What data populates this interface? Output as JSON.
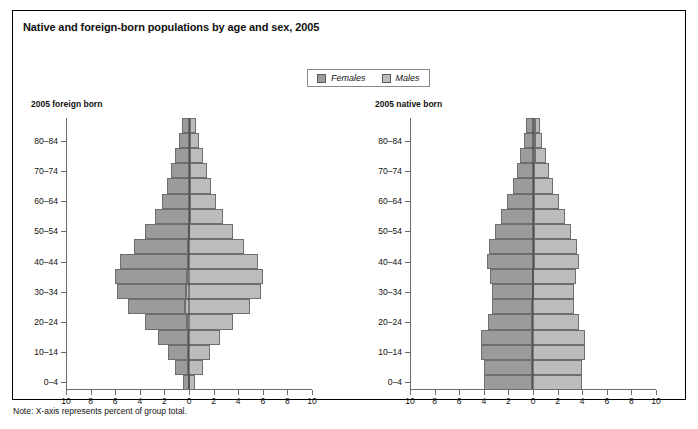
{
  "figure": {
    "title": "Native and foreign-born populations by age and sex, 2005",
    "note": "Note:  X-axis represents percent of group total."
  },
  "legend": {
    "entries": [
      {
        "label": "Females",
        "color": "#9b9b9b",
        "key": "females"
      },
      {
        "label": "Males",
        "color": "#bcbcbc",
        "key": "males"
      }
    ]
  },
  "panels": [
    {
      "id": "foreign",
      "title": "2005 foreign born"
    },
    {
      "id": "native",
      "title": "2005 native born"
    }
  ],
  "axis": {
    "x_tick_labels": [
      "10",
      "8",
      "6",
      "4",
      "2",
      "0",
      "2",
      "4",
      "6",
      "8",
      "10"
    ],
    "x_min": -10,
    "x_max": 10,
    "y_tick_labels": [
      "0–4",
      "10–14",
      "20–24",
      "30–34",
      "40–44",
      "50–54",
      "60–64",
      "70–74",
      "80–84"
    ]
  },
  "chart_data": {
    "type": "bar",
    "subtype": "population-pyramid",
    "title": "Native and foreign-born populations by age and sex, 2005",
    "xlabel": "X-axis represents percent of group total.",
    "ylabel": "Age group",
    "xlim": [
      -10,
      10
    ],
    "grid": false,
    "legend_position": "top-center",
    "age_groups": [
      "0–4",
      "5–9",
      "10–14",
      "15–19",
      "20–24",
      "25–29",
      "30–34",
      "35–39",
      "40–44",
      "45–49",
      "50–54",
      "55–59",
      "60–64",
      "65–69",
      "70–74",
      "75–79",
      "80–84",
      "85+"
    ],
    "panels": [
      {
        "name": "2005 foreign born",
        "series": [
          {
            "name": "Females",
            "values": [
              0.5,
              1.1,
              1.6,
              2.4,
              3.4,
              4.7,
              5.6,
              5.8,
              5.5,
              4.4,
              3.6,
              2.8,
              2.3,
              1.9,
              1.6,
              1.2,
              0.9,
              0.7
            ]
          },
          {
            "name": "Males",
            "values": [
              0.5,
              1.2,
              1.8,
              2.6,
              3.8,
              5.3,
              6.1,
              6.2,
              5.7,
              4.5,
              3.6,
              2.7,
              2.1,
              1.7,
              1.4,
              1.0,
              0.7,
              0.5
            ]
          }
        ]
      },
      {
        "name": "2005 native born",
        "series": [
          {
            "name": "Females",
            "values": [
              3.9,
              3.9,
              4.1,
              4.1,
              3.6,
              3.3,
              3.3,
              3.5,
              3.8,
              3.6,
              3.2,
              2.7,
              2.2,
              1.7,
              1.4,
              1.2,
              0.9,
              0.8
            ]
          },
          {
            "name": "Males",
            "values": [
              4.1,
              4.1,
              4.3,
              4.3,
              3.8,
              3.4,
              3.3,
              3.5,
              3.7,
              3.5,
              3.0,
              2.5,
              2.0,
              1.5,
              1.2,
              0.9,
              0.6,
              0.4
            ]
          }
        ]
      }
    ]
  }
}
